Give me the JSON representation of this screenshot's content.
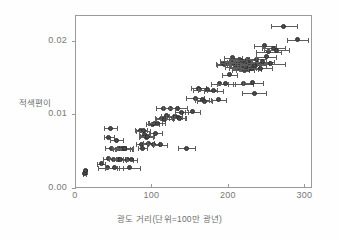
{
  "chart_data": {
    "type": "scatter",
    "title": "",
    "xlabel": "광도 거리(단위=100만 광년)",
    "ylabel": "적색편이",
    "xlim": [
      0,
      310
    ],
    "ylim": [
      0,
      0.0235
    ],
    "xticks": [
      0,
      100,
      200,
      300
    ],
    "xticklabels": [
      "0",
      "100",
      "200",
      "300"
    ],
    "yticks": [
      0.0,
      0.01,
      0.02
    ],
    "yticklabels": [
      "0.00",
      "0.01",
      "0.02"
    ],
    "grid": false,
    "legend": null,
    "marker": "filled-circle",
    "marker_color": "#4a4a4a",
    "errorbar_color": "#5d5d5d",
    "errorbar_orientation": "horizontal",
    "frame_color": "#9a9a9a",
    "background_color": "#ffffff",
    "series": [
      {
        "name": "초신성 관측",
        "points": [
          {
            "x": 11,
            "y": 0.0021,
            "xerr": 2
          },
          {
            "x": 12,
            "y": 0.00225,
            "xerr": 2
          },
          {
            "x": 12,
            "y": 0.00245,
            "xerr": 2
          },
          {
            "x": 33,
            "y": 0.00345,
            "xerr": 5
          },
          {
            "x": 41,
            "y": 0.0029,
            "xerr": 12
          },
          {
            "x": 42,
            "y": 0.0041,
            "xerr": 7
          },
          {
            "x": 43,
            "y": 0.007,
            "xerr": 7
          },
          {
            "x": 45,
            "y": 0.00825,
            "xerr": 9
          },
          {
            "x": 47,
            "y": 0.00555,
            "xerr": 9
          },
          {
            "x": 49,
            "y": 0.00405,
            "xerr": 6
          },
          {
            "x": 50,
            "y": 0.0029,
            "xerr": 12
          },
          {
            "x": 53,
            "y": 0.0066,
            "xerr": 8
          },
          {
            "x": 55,
            "y": 0.00405,
            "xerr": 6
          },
          {
            "x": 56,
            "y": 0.00555,
            "xerr": 9
          },
          {
            "x": 58,
            "y": 0.00405,
            "xerr": 6
          },
          {
            "x": 60,
            "y": 0.0055,
            "xerr": 11
          },
          {
            "x": 62,
            "y": 0.00545,
            "xerr": 11
          },
          {
            "x": 63,
            "y": 0.0055,
            "xerr": 11
          },
          {
            "x": 64,
            "y": 0.00555,
            "xerr": 11
          },
          {
            "x": 68,
            "y": 0.004,
            "xerr": 7
          },
          {
            "x": 70,
            "y": 0.0029,
            "xerr": 14
          },
          {
            "x": 73,
            "y": 0.004,
            "xerr": 7
          },
          {
            "x": 85,
            "y": 0.008,
            "xerr": 8
          },
          {
            "x": 86,
            "y": 0.0061,
            "xerr": 8
          },
          {
            "x": 87,
            "y": 0.00555,
            "xerr": 6
          },
          {
            "x": 88,
            "y": 0.0079,
            "xerr": 9
          },
          {
            "x": 90,
            "y": 0.0074,
            "xerr": 7
          },
          {
            "x": 92,
            "y": 0.007,
            "xerr": 9
          },
          {
            "x": 93,
            "y": 0.00715,
            "xerr": 9
          },
          {
            "x": 95,
            "y": 0.0062,
            "xerr": 7
          },
          {
            "x": 100,
            "y": 0.0088,
            "xerr": 9
          },
          {
            "x": 101,
            "y": 0.0061,
            "xerr": 8
          },
          {
            "x": 103,
            "y": 0.0089,
            "xerr": 9
          },
          {
            "x": 104,
            "y": 0.0076,
            "xerr": 8
          },
          {
            "x": 106,
            "y": 0.0089,
            "xerr": 10
          },
          {
            "x": 110,
            "y": 0.006,
            "xerr": 9
          },
          {
            "x": 112,
            "y": 0.0096,
            "xerr": 9
          },
          {
            "x": 114,
            "y": 0.011,
            "xerr": 9
          },
          {
            "x": 116,
            "y": 0.0095,
            "xerr": 11
          },
          {
            "x": 119,
            "y": 0.00995,
            "xerr": 8
          },
          {
            "x": 124,
            "y": 0.011,
            "xerr": 10
          },
          {
            "x": 128,
            "y": 0.00975,
            "xerr": 10
          },
          {
            "x": 130,
            "y": 0.00985,
            "xerr": 9
          },
          {
            "x": 133,
            "y": 0.01095,
            "xerr": 12
          },
          {
            "x": 134,
            "y": 0.00965,
            "xerr": 8
          },
          {
            "x": 136,
            "y": 0.0096,
            "xerr": 8
          },
          {
            "x": 138,
            "y": 0.0104,
            "xerr": 9
          },
          {
            "x": 145,
            "y": 0.00555,
            "xerr": 11
          },
          {
            "x": 152,
            "y": 0.0105,
            "xerr": 10
          },
          {
            "x": 156,
            "y": 0.0123,
            "xerr": 12
          },
          {
            "x": 160,
            "y": 0.0137,
            "xerr": 10
          },
          {
            "x": 162,
            "y": 0.01345,
            "xerr": 9
          },
          {
            "x": 165,
            "y": 0.0121,
            "xerr": 9
          },
          {
            "x": 168,
            "y": 0.01195,
            "xerr": 10
          },
          {
            "x": 172,
            "y": 0.0135,
            "xerr": 12
          },
          {
            "x": 180,
            "y": 0.01335,
            "xerr": 12
          },
          {
            "x": 186,
            "y": 0.01215,
            "xerr": 10
          },
          {
            "x": 188,
            "y": 0.0143,
            "xerr": 11
          },
          {
            "x": 192,
            "y": 0.017,
            "xerr": 9
          },
          {
            "x": 194,
            "y": 0.0169,
            "xerr": 9
          },
          {
            "x": 196,
            "y": 0.0143,
            "xerr": 12
          },
          {
            "x": 199,
            "y": 0.01705,
            "xerr": 10
          },
          {
            "x": 201,
            "y": 0.0155,
            "xerr": 10
          },
          {
            "x": 203,
            "y": 0.0174,
            "xerr": 14
          },
          {
            "x": 205,
            "y": 0.0178,
            "xerr": 12
          },
          {
            "x": 206,
            "y": 0.017,
            "xerr": 11
          },
          {
            "x": 208,
            "y": 0.01655,
            "xerr": 13
          },
          {
            "x": 209,
            "y": 0.0172,
            "xerr": 11
          },
          {
            "x": 210,
            "y": 0.0168,
            "xerr": 12
          },
          {
            "x": 212,
            "y": 0.01645,
            "xerr": 12
          },
          {
            "x": 213,
            "y": 0.01705,
            "xerr": 13
          },
          {
            "x": 214,
            "y": 0.0176,
            "xerr": 12
          },
          {
            "x": 215,
            "y": 0.0162,
            "xerr": 11
          },
          {
            "x": 216,
            "y": 0.0169,
            "xerr": 13
          },
          {
            "x": 218,
            "y": 0.01735,
            "xerr": 12
          },
          {
            "x": 219,
            "y": 0.0143,
            "xerr": 13
          },
          {
            "x": 220,
            "y": 0.0166,
            "xerr": 14
          },
          {
            "x": 221,
            "y": 0.01615,
            "xerr": 12
          },
          {
            "x": 222,
            "y": 0.01715,
            "xerr": 14
          },
          {
            "x": 223,
            "y": 0.01645,
            "xerr": 12
          },
          {
            "x": 224,
            "y": 0.01755,
            "xerr": 13
          },
          {
            "x": 225,
            "y": 0.0169,
            "xerr": 14
          },
          {
            "x": 226,
            "y": 0.01625,
            "xerr": 12
          },
          {
            "x": 228,
            "y": 0.017,
            "xerr": 13
          },
          {
            "x": 229,
            "y": 0.01635,
            "xerr": 13
          },
          {
            "x": 231,
            "y": 0.01445,
            "xerr": 13
          },
          {
            "x": 233,
            "y": 0.013,
            "xerr": 16
          },
          {
            "x": 234,
            "y": 0.0168,
            "xerr": 14
          },
          {
            "x": 236,
            "y": 0.0176,
            "xerr": 13
          },
          {
            "x": 238,
            "y": 0.01705,
            "xerr": 14
          },
          {
            "x": 241,
            "y": 0.0164,
            "xerr": 16
          },
          {
            "x": 244,
            "y": 0.0173,
            "xerr": 15
          },
          {
            "x": 247,
            "y": 0.01945,
            "xerr": 14
          },
          {
            "x": 249,
            "y": 0.01795,
            "xerr": 13
          },
          {
            "x": 252,
            "y": 0.01865,
            "xerr": 16
          },
          {
            "x": 255,
            "y": 0.017,
            "xerr": 18
          },
          {
            "x": 258,
            "y": 0.0191,
            "xerr": 15
          },
          {
            "x": 262,
            "y": 0.01885,
            "xerr": 16
          },
          {
            "x": 272,
            "y": 0.0221,
            "xerr": 17
          },
          {
            "x": 290,
            "y": 0.0203,
            "xerr": 14
          }
        ]
      }
    ]
  }
}
